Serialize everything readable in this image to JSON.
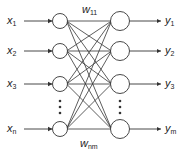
{
  "inputs": [
    {
      "base": "x",
      "sub": "1",
      "y": 21
    },
    {
      "base": "x",
      "sub": "2",
      "y": 51
    },
    {
      "base": "x",
      "sub": "3",
      "y": 84
    },
    {
      "base": "x",
      "sub": "n",
      "y": 129
    }
  ],
  "outputs": [
    {
      "base": "y",
      "sub": "1",
      "y": 21
    },
    {
      "base": "y",
      "sub": "2",
      "y": 51
    },
    {
      "base": "y",
      "sub": "3",
      "y": 84
    },
    {
      "base": "y",
      "sub": "m",
      "y": 129
    }
  ],
  "weights": {
    "top": {
      "base": "w",
      "sub": "11"
    },
    "bottom": {
      "base": "w",
      "sub": "nm"
    }
  },
  "ellipsis": "⋮",
  "colors": {
    "stroke": "#333333",
    "text": "#222222"
  }
}
